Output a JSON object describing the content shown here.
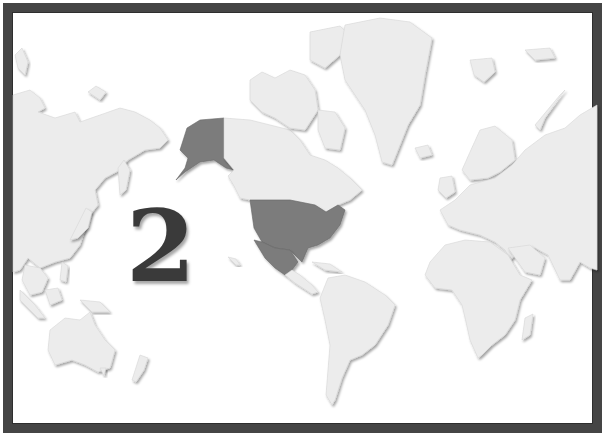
{
  "map": {
    "type": "world-map",
    "projection": "mercator",
    "label": "2",
    "highlighted_regions": [
      "Alaska",
      "United States (contiguous)",
      "Mexico"
    ],
    "colors": {
      "frame": "#454545",
      "background": "#ffffff",
      "land": "#ececec",
      "highlight": "#7b7b7b",
      "label": "#3a3a3a"
    }
  }
}
